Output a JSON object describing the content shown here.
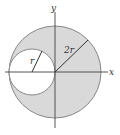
{
  "diagram": {
    "axes": {
      "x_label": "x",
      "y_label": "y"
    },
    "large_circle": {
      "radius_label": "2r",
      "fill": "#d9d9d9",
      "stroke": "#888888"
    },
    "small_circle": {
      "radius_label": "r",
      "fill": "#ffffff",
      "stroke": "#888888"
    },
    "colors": {
      "axis": "#444444",
      "radius_line": "#333333"
    }
  }
}
